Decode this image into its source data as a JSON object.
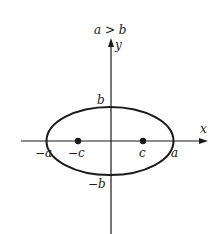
{
  "diagram": {
    "type": "ellipse-foci",
    "condition_label": "a > b",
    "axes": {
      "x_label": "x",
      "y_label": "y"
    },
    "labels": {
      "b_top": "b",
      "b_bottom": "−b",
      "a_left": "−a",
      "a_right": "a",
      "c_left": "−c",
      "c_right": "c"
    },
    "foci": [
      {
        "name": "focus-left",
        "label": "−c"
      },
      {
        "name": "focus-right",
        "label": "c"
      }
    ],
    "colors": {
      "stroke": "#1a1a1a",
      "background": "#ffffff"
    }
  }
}
